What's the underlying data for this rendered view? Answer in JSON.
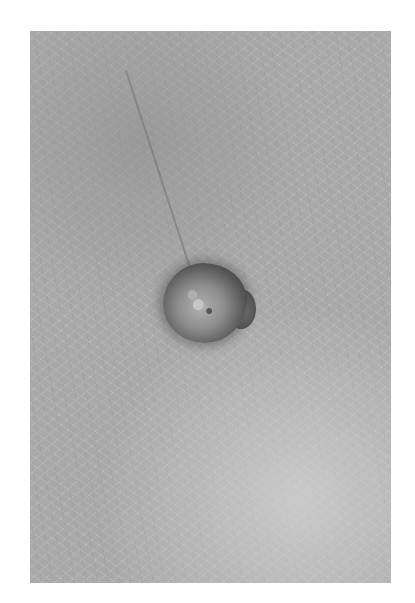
{
  "image": {
    "subject": "close-up grayscale photograph of a skin lesion on textured skin",
    "background_color": "#ffffff",
    "photo_frame": {
      "left": 30,
      "top": 31,
      "width": 361,
      "height": 552
    },
    "skin_tone": "#a9a9a9",
    "lesion": {
      "center": [
        205,
        300
      ],
      "approx_size": [
        85,
        80
      ],
      "rim_color": "#3c3c3c",
      "center_color": "#b0b0b0"
    }
  }
}
